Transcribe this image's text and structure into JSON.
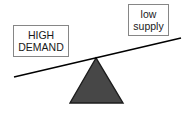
{
  "diagram": {
    "type": "balance-seesaw",
    "background_color": "#ffffff"
  },
  "labels": {
    "left": {
      "name": "high-demand",
      "line1": "HIGH",
      "line2": "DEMAND",
      "border_color": "#868686",
      "text_color": "#1a1a1a",
      "side": "left",
      "position": "down"
    },
    "right": {
      "name": "low-supply",
      "line1": "low",
      "line2": "supply",
      "border_color": "#868686",
      "text_color": "#1a1a1a",
      "side": "right",
      "position": "up"
    }
  },
  "seesaw": {
    "plank": {
      "name": "lever-plank",
      "color": "#000000",
      "stroke_width": 1.6,
      "x1": 14,
      "y1": 77,
      "x2": 181,
      "y2": 38,
      "tilt": "left-side-down"
    },
    "fulcrum": {
      "name": "fulcrum-triangle",
      "fill_color": "#474747",
      "stroke_color": "#1c1c1c",
      "stroke_width": 1.4,
      "apex_x": 96,
      "apex_y": 58,
      "base_left_x": 70,
      "base_right_x": 123,
      "base_y": 103
    }
  }
}
